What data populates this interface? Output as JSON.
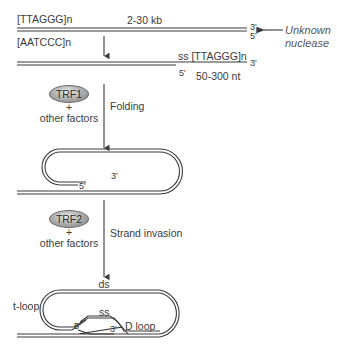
{
  "diagram": {
    "title": "",
    "step1": {
      "top_strand_label": "[TTAGGG]n",
      "length_label": "2-30 kb",
      "bottom_strand_label": "[AATCCC]n",
      "end_top": "3'",
      "end_bottom": "5'",
      "enzyme_label_line1": "Unknown",
      "enzyme_label_line2": "nuclease"
    },
    "step2": {
      "overhang_label": "ss [TTAGGG]n",
      "end_top": "3'",
      "end_bottom": "5'",
      "overhang_length": "50-300 nt"
    },
    "transition1": {
      "protein": "TRF1",
      "plus": "+",
      "cofactors": "other factors",
      "process": "Folding"
    },
    "step3": {
      "end_3": "3'",
      "end_5": "5'"
    },
    "transition2": {
      "protein": "TRF2",
      "plus": "+",
      "cofactors": "other factors",
      "process": "Strand invasion"
    },
    "step4": {
      "ds_label": "ds",
      "tloop_label": "t-loop",
      "ss_label": "ss",
      "dloop_label": "D loop",
      "end_5": "5'",
      "end_3": "3'"
    },
    "colors": {
      "line": "#3a3a3a",
      "protein_fill": "#a9a9a9",
      "text": "#3a3a3a"
    }
  }
}
